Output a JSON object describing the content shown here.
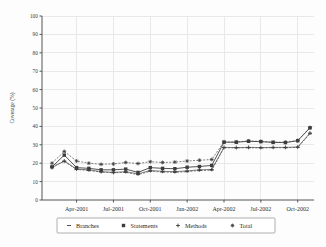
{
  "chart_data": {
    "type": "line",
    "title": "",
    "xlabel": "",
    "ylabel": "Coverage (%)",
    "ylim": [
      0,
      100
    ],
    "ytick_labels": [
      "0",
      "10",
      "20",
      "30",
      "40",
      "50",
      "60",
      "70",
      "80",
      "90",
      "100"
    ],
    "ytick_values": [
      0,
      10,
      20,
      30,
      40,
      50,
      60,
      70,
      80,
      90,
      100
    ],
    "xtick_labels": [
      "Apr-2001",
      "Jul-2001",
      "Oct-2001",
      "Jan-2002",
      "Apr-2002",
      "Jul-2002",
      "Oct-2002"
    ],
    "xtick_positions": [
      2,
      5,
      8,
      11,
      14,
      17,
      20
    ],
    "x": [
      0,
      1,
      2,
      3,
      4,
      5,
      6,
      7,
      8,
      9,
      10,
      11,
      12,
      13,
      14,
      15,
      16,
      17,
      18,
      19,
      20,
      21
    ],
    "grid": true,
    "legend_position": "bottom",
    "marker_color": "#3c3c3c",
    "line_color": "#4a4a4a",
    "grid_color": "#e9e9e9",
    "series": [
      {
        "name": "Branches",
        "marker": "dash",
        "values": [
          18.2,
          21.0,
          16.6,
          16.0,
          15.2,
          14.8,
          15.0,
          13.8,
          15.6,
          15.2,
          15.0,
          15.4,
          16.0,
          16.2,
          28.4,
          28.3,
          28.4,
          28.3,
          28.4,
          28.4,
          28.6,
          36.0
        ]
      },
      {
        "name": "Statements",
        "marker": "plus-filled",
        "values": [
          18.0,
          24.4,
          17.6,
          17.2,
          16.4,
          16.4,
          16.8,
          15.0,
          17.6,
          17.2,
          17.0,
          17.8,
          18.2,
          18.8,
          31.4,
          31.4,
          31.9,
          31.7,
          31.3,
          31.2,
          32.2,
          39.2
        ]
      },
      {
        "name": "Methods",
        "marker": "plus",
        "values": [
          17.6,
          21.2,
          16.8,
          16.4,
          15.4,
          15.0,
          15.4,
          14.2,
          16.0,
          15.6,
          15.4,
          15.8,
          16.4,
          16.6,
          28.6,
          28.5,
          28.6,
          28.5,
          28.6,
          28.6,
          28.8,
          36.4
        ]
      },
      {
        "name": "Total",
        "marker": "star",
        "values": [
          20.0,
          26.4,
          21.2,
          20.0,
          19.4,
          19.6,
          20.4,
          19.8,
          20.8,
          20.4,
          20.6,
          21.2,
          21.6,
          22.0,
          31.6,
          31.6,
          32.1,
          31.9,
          31.5,
          31.4,
          32.4,
          39.4
        ]
      }
    ]
  },
  "legend": {
    "entries": [
      {
        "label": "Branches",
        "marker": "dash"
      },
      {
        "label": "Statements",
        "marker": "plus-filled"
      },
      {
        "label": "Methods",
        "marker": "plus"
      },
      {
        "label": "Total",
        "marker": "star"
      }
    ]
  }
}
